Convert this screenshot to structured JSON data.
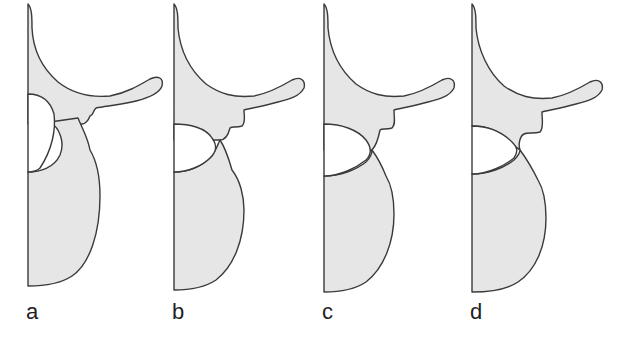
{
  "figure": {
    "colors": {
      "bone_fill": "#e6e6e6",
      "bone_outline": "#3a3a3a",
      "stipple": "#6e6e6e",
      "background": "#ffffff"
    },
    "panels": [
      {
        "id": "a",
        "label": "a",
        "stage": 1,
        "joint_gap": "wide"
      },
      {
        "id": "b",
        "label": "b",
        "stage": 2,
        "joint_gap": "narrowing"
      },
      {
        "id": "c",
        "label": "c",
        "stage": 3,
        "joint_gap": "narrow"
      },
      {
        "id": "d",
        "label": "d",
        "stage": 4,
        "joint_gap": "contact"
      }
    ]
  }
}
